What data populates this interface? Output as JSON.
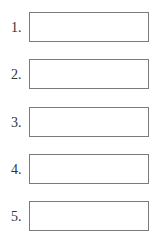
{
  "form": {
    "items": [
      {
        "label": "1.",
        "value": "",
        "top": 12
      },
      {
        "label": "2.",
        "value": "",
        "top": 59
      },
      {
        "label": "3.",
        "value": "",
        "top": 107
      },
      {
        "label": "4.",
        "value": "",
        "top": 154
      },
      {
        "label": "5.",
        "value": "",
        "top": 201
      }
    ]
  },
  "colors": {
    "border": "#7a7a7a",
    "label": "#333333",
    "background": "#ffffff"
  }
}
